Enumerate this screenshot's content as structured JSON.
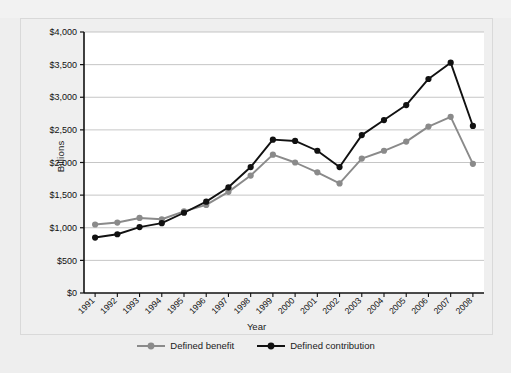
{
  "chart_data": {
    "type": "line",
    "title": "",
    "xlabel": "Year",
    "ylabel": "Billions",
    "categories": [
      "1991",
      "1992",
      "1993",
      "1994",
      "1995",
      "1996",
      "1997",
      "1998",
      "1999",
      "2000",
      "2001",
      "2002",
      "2003",
      "2004",
      "2005",
      "2006",
      "2007",
      "2008"
    ],
    "ylim": [
      0,
      4000
    ],
    "ytick_values": [
      0,
      500,
      1000,
      1500,
      2000,
      2500,
      3000,
      3500,
      4000
    ],
    "ytick_labels": [
      "$0",
      "$500",
      "$1,000",
      "$1,500",
      "$2,000",
      "$2,500",
      "$3,000",
      "$3,500",
      "$4,000"
    ],
    "grid": true,
    "legend_position": "bottom",
    "series": [
      {
        "name": "Defined benefit",
        "color": "#8a8a8a",
        "marker": "circle",
        "values": [
          1050,
          1080,
          1150,
          1130,
          1250,
          1350,
          1550,
          1800,
          2120,
          2000,
          1850,
          1680,
          2060,
          2180,
          2320,
          2550,
          2700,
          1980
        ]
      },
      {
        "name": "Defined contribution",
        "color": "#111111",
        "marker": "circle",
        "values": [
          850,
          900,
          1010,
          1070,
          1230,
          1400,
          1620,
          1930,
          2350,
          2330,
          2180,
          1930,
          2420,
          2650,
          2880,
          3280,
          3530,
          2560
        ]
      }
    ]
  },
  "colors": {
    "background": "#eeeeee",
    "plot_background": "#ffffff",
    "grid": "#b8b8b8",
    "axis": "#111111",
    "defined_benefit": "#8a8a8a",
    "defined_contribution": "#111111"
  }
}
